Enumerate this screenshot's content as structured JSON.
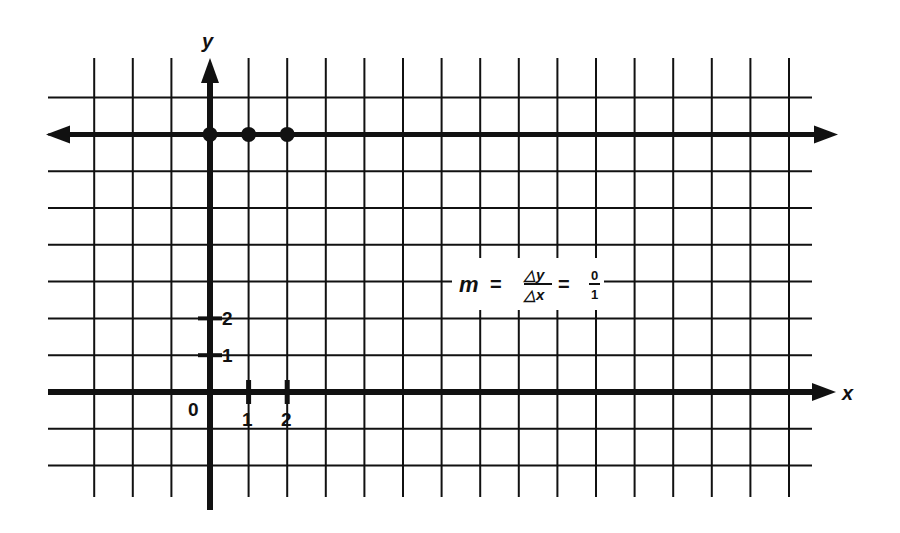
{
  "figure": {
    "kind": "coordinate-plane",
    "ink_color": "#111111",
    "background": "#ffffff",
    "axes": {
      "x_label": "x",
      "y_label": "y",
      "origin_label": "0",
      "x_tick_labels": [
        "1",
        "2"
      ],
      "y_tick_labels": [
        "1",
        "2"
      ]
    },
    "grid": {
      "vertical_lines": 19,
      "horizontal_lines": 11,
      "columns_left_of_y_axis": 3,
      "columns_right_of_y_axis": 15,
      "rows_above_x_axis": 8,
      "rows_below_x_axis": 2
    },
    "line": {
      "description": "horizontal line y = 7, arrows both ends",
      "equation": "y = 7",
      "points": [
        {
          "x": 0,
          "y": 7
        },
        {
          "x": 1,
          "y": 7
        },
        {
          "x": 2,
          "y": 7
        }
      ]
    },
    "formula": {
      "lhs": "m",
      "equals": "=",
      "numerator_symbol": "△y",
      "denominator_symbol": "△x",
      "equals2": "=",
      "numerator_value": "0",
      "denominator_value": "1"
    }
  }
}
